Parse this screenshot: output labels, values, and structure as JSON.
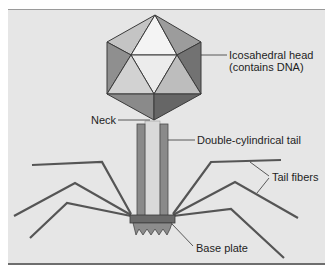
{
  "labels": {
    "head_line1": "Icosahedral head",
    "head_line2": "(contains DNA)",
    "neck": "Neck",
    "tail": "Double-cylindrical tail",
    "tail_fibers": "Tail fibers",
    "base_plate": "Base plate"
  },
  "colors": {
    "background": "#e6e6e6",
    "face_light": "#f2f2f2",
    "face_mid": "#c8c8c8",
    "face_dark": "#8e8e8e",
    "face_darker": "#6f6f6f",
    "edge": "#3a3a3a",
    "tail_outer": "#8a8a8a",
    "tail_core": "#d9d9d9",
    "fiber": "#555555",
    "base_plate": "#6a6a6a"
  }
}
